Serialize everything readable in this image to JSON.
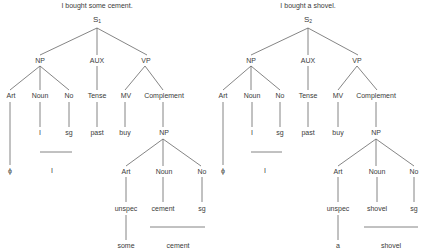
{
  "trees": [
    {
      "title": "I bought some cement.",
      "root": {
        "label": "S",
        "sub": "1"
      },
      "level1": {
        "np": "NP",
        "aux": "AUX",
        "vp": "VP"
      },
      "level2": {
        "art": "Art",
        "noun": "Noun",
        "no": "No",
        "tense": "Tense",
        "mv": "MV",
        "complement": "Complement"
      },
      "level3": {
        "noun_val": "I",
        "no_val": "sg",
        "tense_val": "past",
        "mv_val": "buy",
        "np": "NP"
      },
      "subject_surface": {
        "art": "ϕ",
        "noun": "I"
      },
      "object": {
        "art": "Art",
        "noun": "Noun",
        "no": "No",
        "art_val": "unspec",
        "noun_val": "cement",
        "no_val": "sg",
        "art_surface": "some",
        "noun_surface": "cement"
      }
    },
    {
      "title": "I bought a shovel.",
      "root": {
        "label": "S",
        "sub": "2"
      },
      "level1": {
        "np": "NP",
        "aux": "AUX",
        "vp": "VP"
      },
      "level2": {
        "art": "Art",
        "noun": "Noun",
        "no": "No",
        "tense": "Tense",
        "mv": "MV",
        "complement": "Complement"
      },
      "level3": {
        "noun_val": "I",
        "no_val": "sg",
        "tense_val": "past",
        "mv_val": "buy",
        "np": "NP"
      },
      "subject_surface": {
        "art": "ϕ",
        "noun": "I"
      },
      "object": {
        "art": "Art",
        "noun": "Noun",
        "no": "No",
        "art_val": "unspec",
        "noun_val": "shovel",
        "no_val": "sg",
        "art_surface": "a",
        "noun_surface": "shovel"
      }
    }
  ],
  "colors": {
    "line": "#555555",
    "text": "#3a3a3a",
    "background": "#ffffff"
  }
}
